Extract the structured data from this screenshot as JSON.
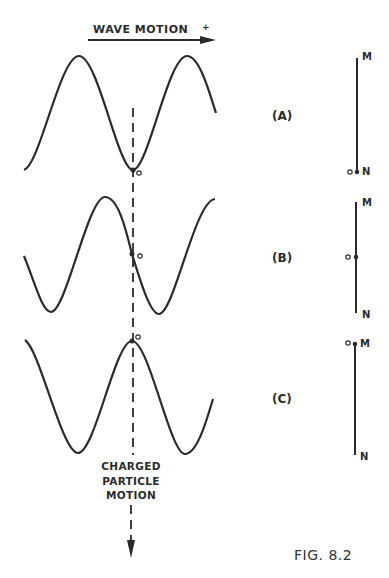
{
  "title": "WAVE MOTION",
  "wave_motion_label": "WAVE MOTION",
  "particle_motion_label": [
    "CHARGED",
    "PARTICLE",
    "MOTION"
  ],
  "figure_caption": "FIG. 8.2",
  "panels": [
    {
      "id": "A",
      "label": "(A)",
      "origin_label": "O",
      "top_label": "M",
      "bottom_label": "N",
      "particle_position": "at N (trough)"
    },
    {
      "id": "B",
      "label": "(B)",
      "origin_label": "O",
      "top_label": "M",
      "bottom_label": "N",
      "particle_position": "midpoint (zero crossing)"
    },
    {
      "id": "C",
      "label": "(C)",
      "origin_label": "O",
      "top_label": "M",
      "bottom_label": "N",
      "particle_position": "at M (crest)"
    }
  ],
  "colors": {
    "ink": "#2b2b2b",
    "background": "#ffffff"
  }
}
